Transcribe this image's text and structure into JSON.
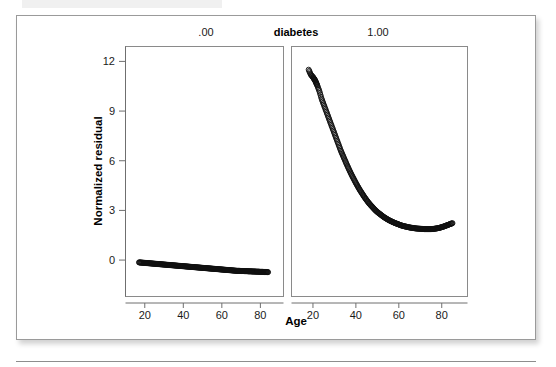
{
  "figure": {
    "frame_visible": true,
    "background_color": "#ffffff",
    "border_color": "#9a9a9a",
    "rule_color": "#8d8d8d"
  },
  "chart_data": {
    "type": "scatter",
    "title": "",
    "subtitle": "",
    "xlabel": "Age",
    "ylabel": "Normalized residual",
    "strip_variable_label": "diabetes",
    "grid": false,
    "legend_position": "none",
    "point_marker": "open-circle",
    "point_color": "#101010",
    "xlim": [
      10,
      92
    ],
    "ylim": [
      -2.2,
      12.9
    ],
    "xticks": [
      20,
      40,
      60,
      80
    ],
    "xtick_labels": [
      "20",
      "40",
      "60",
      "80"
    ],
    "yticks": [
      0,
      3,
      6,
      9,
      12
    ],
    "ytick_labels": [
      "0",
      "3",
      "6",
      "9",
      "12"
    ],
    "panels": [
      {
        "strip_label": ".00",
        "name": "diabetes-0",
        "series_name": "Normalized residual (diabetes = .00)",
        "x": [
          17,
          18,
          19,
          20,
          21,
          22,
          23,
          24,
          25,
          26,
          27,
          28,
          29,
          30,
          31,
          32,
          33,
          34,
          35,
          36,
          37,
          38,
          39,
          40,
          41,
          42,
          43,
          44,
          45,
          46,
          47,
          48,
          49,
          50,
          51,
          52,
          53,
          54,
          55,
          56,
          57,
          58,
          59,
          60,
          61,
          62,
          63,
          64,
          65,
          66,
          67,
          68,
          69,
          70,
          71,
          72,
          73,
          74,
          75,
          76,
          77,
          78,
          79,
          80,
          81,
          82,
          83,
          84
        ],
        "y": [
          -0.14,
          -0.15,
          -0.16,
          -0.17,
          -0.18,
          -0.19,
          -0.2,
          -0.21,
          -0.22,
          -0.23,
          -0.24,
          -0.25,
          -0.26,
          -0.27,
          -0.28,
          -0.29,
          -0.3,
          -0.31,
          -0.32,
          -0.33,
          -0.34,
          -0.35,
          -0.36,
          -0.37,
          -0.38,
          -0.39,
          -0.4,
          -0.41,
          -0.42,
          -0.43,
          -0.44,
          -0.45,
          -0.46,
          -0.47,
          -0.48,
          -0.49,
          -0.5,
          -0.51,
          -0.52,
          -0.53,
          -0.54,
          -0.55,
          -0.56,
          -0.57,
          -0.58,
          -0.59,
          -0.6,
          -0.61,
          -0.62,
          -0.63,
          -0.64,
          -0.65,
          -0.65,
          -0.66,
          -0.66,
          -0.67,
          -0.67,
          -0.68,
          -0.68,
          -0.69,
          -0.69,
          -0.7,
          -0.7,
          -0.71,
          -0.71,
          -0.72,
          -0.72,
          -0.73
        ]
      },
      {
        "strip_label": "1.00",
        "name": "diabetes-1",
        "series_name": "Normalized residual (diabetes = 1.00)",
        "x": [
          18,
          19,
          20,
          20.5,
          21,
          21.5,
          22,
          23,
          24,
          25,
          26,
          27,
          28,
          29,
          30,
          31,
          32,
          33,
          34,
          35,
          36,
          37,
          38,
          39,
          40,
          41,
          42,
          43,
          44,
          45,
          46,
          47,
          48,
          49,
          50,
          51,
          52,
          53,
          54,
          55,
          56,
          57,
          58,
          59,
          60,
          61,
          62,
          63,
          64,
          65,
          66,
          67,
          68,
          69,
          70,
          71,
          72,
          73,
          74,
          75,
          76,
          77,
          78,
          79,
          80,
          81,
          82,
          83,
          84,
          85
        ],
        "y": [
          11.5,
          11.2,
          11.05,
          10.95,
          10.85,
          10.7,
          10.55,
          10.2,
          9.75,
          9.4,
          9.05,
          8.7,
          8.35,
          8.0,
          7.65,
          7.3,
          6.95,
          6.6,
          6.3,
          6.0,
          5.7,
          5.42,
          5.15,
          4.9,
          4.65,
          4.42,
          4.2,
          4.0,
          3.8,
          3.62,
          3.45,
          3.3,
          3.16,
          3.02,
          2.9,
          2.8,
          2.7,
          2.6,
          2.52,
          2.44,
          2.37,
          2.31,
          2.25,
          2.2,
          2.15,
          2.1,
          2.06,
          2.03,
          2.0,
          1.97,
          1.95,
          1.93,
          1.91,
          1.9,
          1.89,
          1.88,
          1.87,
          1.87,
          1.87,
          1.87,
          1.88,
          1.9,
          1.92,
          1.95,
          1.99,
          2.03,
          2.08,
          2.13,
          2.18,
          2.23
        ]
      }
    ]
  }
}
